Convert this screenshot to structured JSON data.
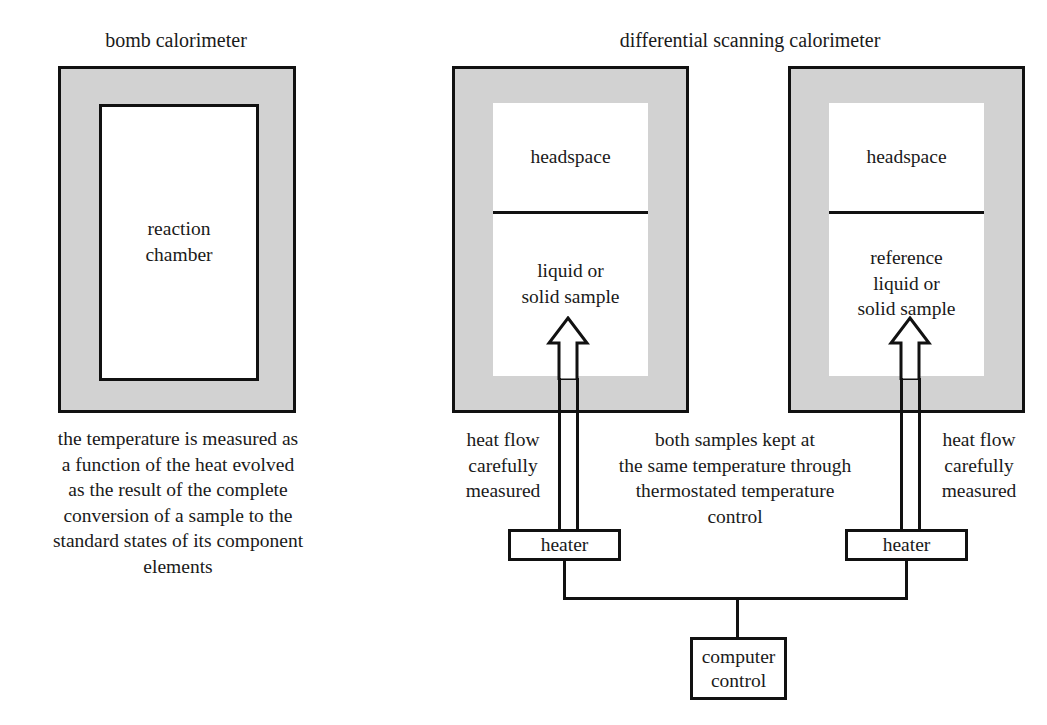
{
  "figure": {
    "left_panel": {
      "title": "bomb calorimeter",
      "chamber_label_line1": "reaction",
      "chamber_label_line2": "chamber",
      "caption_lines": [
        "the temperature is measured as",
        "a function of the heat evolved",
        "as the result of the complete",
        "conversion of a sample to the",
        "standard states of its component",
        "elements"
      ]
    },
    "right_panel": {
      "title": "differential scanning calorimeter",
      "sample_cell": {
        "headspace_label": "headspace",
        "sample_label_line1": "liquid or",
        "sample_label_line2": "solid sample",
        "heater_label": "heater",
        "annotation_lines": [
          "heat flow",
          "carefully",
          "measured"
        ]
      },
      "reference_cell": {
        "headspace_label": "headspace",
        "sample_label_line1": "reference",
        "sample_label_line2": "liquid or",
        "sample_label_line3": "solid sample",
        "heater_label": "heater",
        "annotation_lines": [
          "heat flow",
          "carefully",
          "measured"
        ]
      },
      "center_note_lines": [
        "both samples kept at",
        "the same temperature through",
        "thermostated temperature",
        "control"
      ],
      "computer_label_line1": "computer",
      "computer_label_line2": "control"
    },
    "colors": {
      "vessel_wall": "#d2d2d2",
      "outline": "#111111",
      "interior": "#ffffff",
      "background": "#ffffff"
    }
  }
}
